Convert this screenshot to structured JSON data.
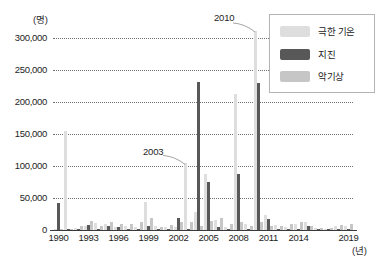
{
  "chart_data": {
    "type": "bar",
    "title": "",
    "subtitle": "",
    "xlabel": "(년)",
    "ylabel": "(명)",
    "grid": true,
    "legend_position": "top-right",
    "ylim": [
      0,
      325000
    ],
    "yticks": [
      "0",
      "50,000",
      "100,000",
      "150,000",
      "200,000",
      "250,000",
      "300,000"
    ],
    "ytick_values": [
      0,
      50000,
      100000,
      150000,
      200000,
      250000,
      300000
    ],
    "xticks": [
      "1990",
      "1993",
      "1996",
      "1999",
      "2002",
      "2005",
      "2008",
      "2011",
      "2014",
      "2019"
    ],
    "xtick_values": [
      1990,
      1993,
      1996,
      1999,
      2002,
      2005,
      2008,
      2011,
      2014,
      2019
    ],
    "x": [
      1990,
      1991,
      1992,
      1993,
      1994,
      1995,
      1996,
      1997,
      1998,
      1999,
      2000,
      2001,
      2002,
      2003,
      2004,
      2005,
      2006,
      2007,
      2008,
      2009,
      2010,
      2011,
      2012,
      2013,
      2014,
      2015,
      2016,
      2017,
      2018,
      2019
    ],
    "series": [
      {
        "name": "극한 기온",
        "color": "#dedede",
        "values": [
          2000,
          155000,
          3000,
          7000,
          11000,
          9000,
          4000,
          6000,
          5000,
          44000,
          6000,
          4000,
          4000,
          104000,
          28000,
          88000,
          16000,
          4000,
          212000,
          9000,
          311000,
          23000,
          8000,
          5000,
          9000,
          12000,
          3000,
          2000,
          6000,
          7000
        ]
      },
      {
        "name": "지진",
        "color": "#585858",
        "values": [
          42000,
          1000,
          2000,
          8000,
          1000,
          6000,
          5000,
          1000,
          2000,
          6000,
          1000,
          1000,
          19000,
          1000,
          232000,
          75000,
          5000,
          1000,
          87000,
          2000,
          229000,
          17000,
          1000,
          1000,
          1000,
          7000,
          1000,
          500,
          1000,
          500
        ]
      },
      {
        "name": "악기상",
        "color": "#c6c6c6",
        "values": [
          1000,
          2000,
          6000,
          14000,
          6000,
          12000,
          9000,
          10000,
          13000,
          18000,
          5000,
          8000,
          13000,
          12000,
          6000,
          14000,
          19000,
          10000,
          13000,
          7000,
          12000,
          6000,
          7000,
          9000,
          13000,
          7000,
          3000,
          3000,
          8000,
          9000
        ]
      }
    ],
    "annotations": [
      {
        "label": "2010",
        "target_year": 2010,
        "target_series": "극한 기온",
        "target_value": 311000
      },
      {
        "label": "2003",
        "target_year": 2003,
        "target_series": "극한 기온",
        "target_value": 104000
      }
    ]
  },
  "legend": {
    "items": [
      {
        "label": "극한 기온",
        "color": "#dedede"
      },
      {
        "label": "지진",
        "color": "#585858"
      },
      {
        "label": "악기상",
        "color": "#c6c6c6"
      }
    ]
  },
  "axes": {
    "y_unit": "(명)",
    "x_unit": "(년)"
  }
}
